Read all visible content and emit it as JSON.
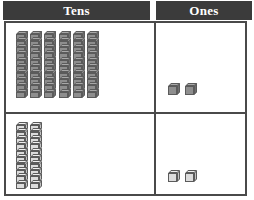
{
  "table": {
    "columns": [
      {
        "key": "tens",
        "label": "Tens"
      },
      {
        "key": "ones",
        "label": "Ones"
      }
    ],
    "rows": [
      {
        "name": "row-1",
        "style": "dark",
        "tens_rods": 6,
        "ones_cubes": 2,
        "tens_value": 60,
        "ones_value": 2,
        "number": 62
      },
      {
        "name": "row-2",
        "style": "light",
        "tens_rods": 2,
        "ones_cubes": 2,
        "tens_value": 20,
        "ones_value": 2,
        "number": 22
      }
    ]
  },
  "block_model": {
    "segments_per_rod": 10,
    "rod_segment_label": "unit-cube",
    "rod_label": "tens-rod",
    "cube_label": "ones-cube"
  },
  "colors": {
    "header_background": "#3b3b3b",
    "header_text": "#ffffff",
    "grid_line": "#4a4a4a",
    "cell_background": "#ffffff",
    "block_dark_face": "#8e8e8e",
    "block_dark_top": "#a8a8a8",
    "block_dark_side": "#6f6f6f",
    "block_light_face": "#dcdcdc",
    "block_light_top": "#efefef",
    "block_light_side": "#c2c2c2",
    "block_outline": "#5b5b5b"
  }
}
